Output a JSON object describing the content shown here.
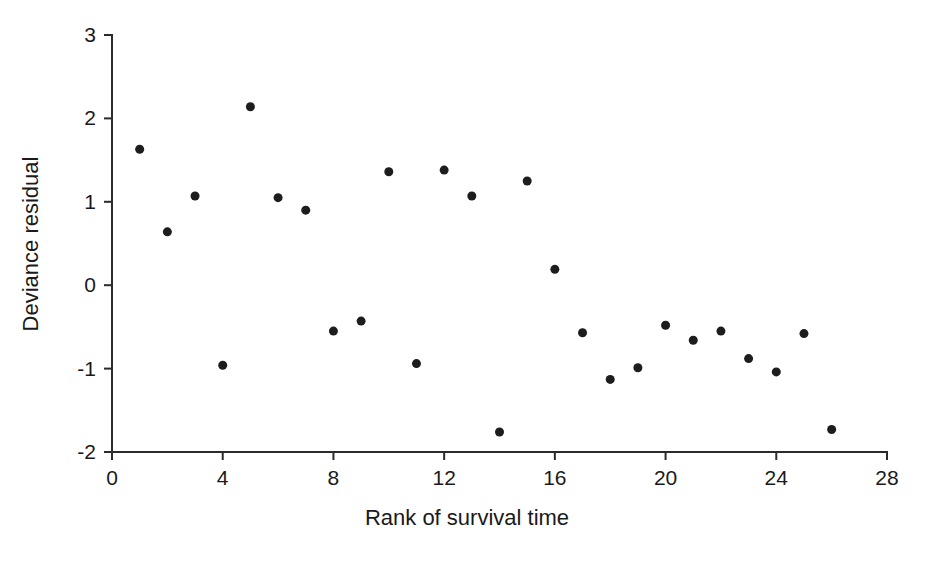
{
  "chart_data": {
    "type": "scatter",
    "title": "",
    "xlabel": "Rank of survival time",
    "ylabel": "Deviance residual",
    "xlim": [
      0,
      28
    ],
    "ylim": [
      -2,
      3
    ],
    "xticks": [
      0,
      4,
      8,
      12,
      16,
      20,
      24,
      28
    ],
    "yticks": [
      -2,
      -1,
      0,
      1,
      2,
      3
    ],
    "xtick_labels": [
      "0",
      "4",
      "8",
      "12",
      "16",
      "20",
      "24",
      "28"
    ],
    "ytick_labels": [
      "-2",
      "-1",
      "0",
      "1",
      "2",
      "3"
    ],
    "grid": false,
    "legend": false,
    "legend_position": "none",
    "marker": "filled-circle",
    "marker_color": "#1d1d1d",
    "marker_size_px": 9,
    "axis_color": "#2b2b2b",
    "background_color": "#ffffff",
    "series": [
      {
        "name": "Deviance residuals",
        "x": [
          1,
          2,
          3,
          4,
          5,
          6,
          7,
          8,
          9,
          10,
          11,
          12,
          13,
          14,
          15,
          16,
          17,
          18,
          19,
          20,
          21,
          22,
          23,
          24,
          25,
          26
        ],
        "y": [
          1.63,
          0.64,
          1.07,
          -0.96,
          2.14,
          1.05,
          0.9,
          -0.55,
          -0.43,
          1.36,
          -0.94,
          1.38,
          1.07,
          -1.76,
          1.25,
          0.19,
          -0.57,
          -1.13,
          -0.99,
          -0.48,
          -0.66,
          -0.55,
          -0.88,
          -1.04,
          -0.58,
          -1.73
        ]
      }
    ],
    "points": [
      {
        "x": 1,
        "y": 1.63
      },
      {
        "x": 2,
        "y": 0.64
      },
      {
        "x": 3,
        "y": 1.07
      },
      {
        "x": 4,
        "y": -0.96
      },
      {
        "x": 5,
        "y": 2.14
      },
      {
        "x": 6,
        "y": 1.05
      },
      {
        "x": 7,
        "y": 0.9
      },
      {
        "x": 8,
        "y": -0.55
      },
      {
        "x": 9,
        "y": -0.43
      },
      {
        "x": 10,
        "y": 1.36
      },
      {
        "x": 11,
        "y": -0.94
      },
      {
        "x": 12,
        "y": 1.38
      },
      {
        "x": 13,
        "y": 1.07
      },
      {
        "x": 14,
        "y": -1.76
      },
      {
        "x": 15,
        "y": 1.25
      },
      {
        "x": 16,
        "y": 0.19
      },
      {
        "x": 17,
        "y": -0.57
      },
      {
        "x": 18,
        "y": -1.13
      },
      {
        "x": 19,
        "y": -0.99
      },
      {
        "x": 20,
        "y": -0.48
      },
      {
        "x": 21,
        "y": -0.66
      },
      {
        "x": 22,
        "y": -0.55
      },
      {
        "x": 23,
        "y": -0.88
      },
      {
        "x": 24,
        "y": -1.04
      },
      {
        "x": 25,
        "y": -0.58
      },
      {
        "x": 26,
        "y": -1.73
      }
    ]
  },
  "geometry": {
    "x_axis_px": {
      "x0": 112,
      "x1": 887,
      "y": 452
    },
    "y_axis_px": {
      "y0": 35,
      "y1": 452,
      "x": 112
    },
    "tick_len": 8
  }
}
